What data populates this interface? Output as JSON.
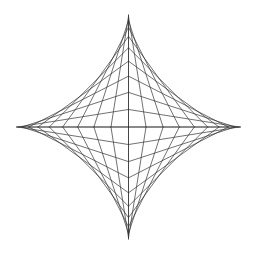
{
  "figure": {
    "type": "string-art astroid envelope",
    "background": "#ffffff",
    "line_color": "#333333",
    "center": [
      128.5,
      127
    ],
    "radius": 112,
    "steps_per_quadrant": 10,
    "quadrants": [
      "upper-right",
      "upper-left",
      "lower-left",
      "lower-right"
    ],
    "tips": {
      "top": [
        128,
        14
      ],
      "bottom": [
        129,
        240
      ],
      "left": [
        17,
        127
      ],
      "right": [
        240,
        127
      ]
    }
  }
}
